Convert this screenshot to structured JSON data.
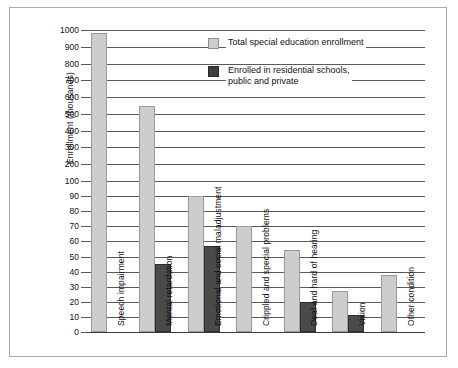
{
  "chart_data": {
    "type": "bar",
    "title": "",
    "xlabel": "",
    "ylabel": "Enrollment (thousands)",
    "grid": true,
    "legend_position": "top-right",
    "axis_scale": "piecewise-linear (0-100 lower half, 100-1000 upper half)",
    "ylim": [
      0,
      1000
    ],
    "ticks": [
      {
        "label": "1000",
        "value": 1000
      },
      {
        "label": "900",
        "value": 900
      },
      {
        "label": "800",
        "value": 800
      },
      {
        "label": "700",
        "value": 700
      },
      {
        "label": "600",
        "value": 600
      },
      {
        "label": "500",
        "value": 500
      },
      {
        "label": "400",
        "value": 400
      },
      {
        "label": "300",
        "value": 300
      },
      {
        "label": "200",
        "value": 200
      },
      {
        "label": "100",
        "value": 100
      },
      {
        "label": "90",
        "value": 90
      },
      {
        "label": "80",
        "value": 80
      },
      {
        "label": "70",
        "value": 70
      },
      {
        "label": "60",
        "value": 60
      },
      {
        "label": "50",
        "value": 50
      },
      {
        "label": "40",
        "value": 40
      },
      {
        "label": "30",
        "value": 30
      },
      {
        "label": "20",
        "value": 20
      },
      {
        "label": "10",
        "value": 10
      },
      {
        "label": "0",
        "value": 0
      }
    ],
    "categories": [
      "Speech impairment",
      "Mental retardation",
      "Emotional and social maladjustment",
      "Crippled and special problems",
      "Deaf and hard of hearing",
      "Vision",
      "Other condition"
    ],
    "series": [
      {
        "name": "Total special education enrollment",
        "color": "#cdcdcd",
        "values": [
          985,
          550,
          90,
          70,
          54,
          27,
          38
        ]
      },
      {
        "name": "Enrolled in residential schools, public and private",
        "color": "#4a4a4a",
        "values": [
          null,
          45,
          57,
          null,
          20,
          11,
          null
        ]
      }
    ]
  },
  "legend": {
    "items": [
      {
        "label": "Total special education enrollment",
        "swatch": "total"
      },
      {
        "label": "Enrolled in residential schools,\npublic and private",
        "swatch": "resid"
      }
    ]
  }
}
